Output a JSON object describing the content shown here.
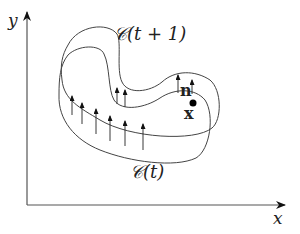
{
  "diagram": {
    "axes": {
      "x_label": "x",
      "y_label": "y"
    },
    "curves": [
      {
        "id": "curve-t",
        "label": "𝒞(t)"
      },
      {
        "id": "curve-t-plus-1",
        "label": "𝒞(t + 1)"
      }
    ],
    "point_label": "x",
    "normal_label": "n",
    "colors": {
      "stroke": "#333333",
      "point": "#000000",
      "background": "#ffffff"
    }
  }
}
